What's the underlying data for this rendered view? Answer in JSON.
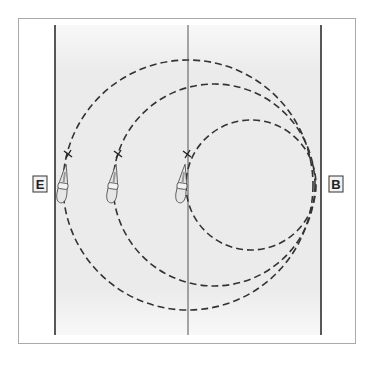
{
  "diagram": {
    "type": "riding-arena-circles",
    "markers": {
      "left": "E",
      "right": "B"
    },
    "circles": [
      {
        "name": "large-circle",
        "cx": 188,
        "cy": 185,
        "r": 125
      },
      {
        "name": "medium-circle",
        "cx": 214,
        "cy": 185,
        "r": 101
      },
      {
        "name": "small-circle",
        "cx": 251,
        "cy": 185,
        "r": 65
      }
    ],
    "riders": [
      {
        "name": "rider-large-circle",
        "x": 62,
        "y": 175
      },
      {
        "name": "rider-medium-circle",
        "x": 113,
        "y": 175
      },
      {
        "name": "rider-small-circle",
        "x": 185,
        "y": 175
      }
    ],
    "colors": {
      "arena_fill": "#ebebeb",
      "line": "#222222",
      "frame": "#aaaaaa"
    }
  }
}
